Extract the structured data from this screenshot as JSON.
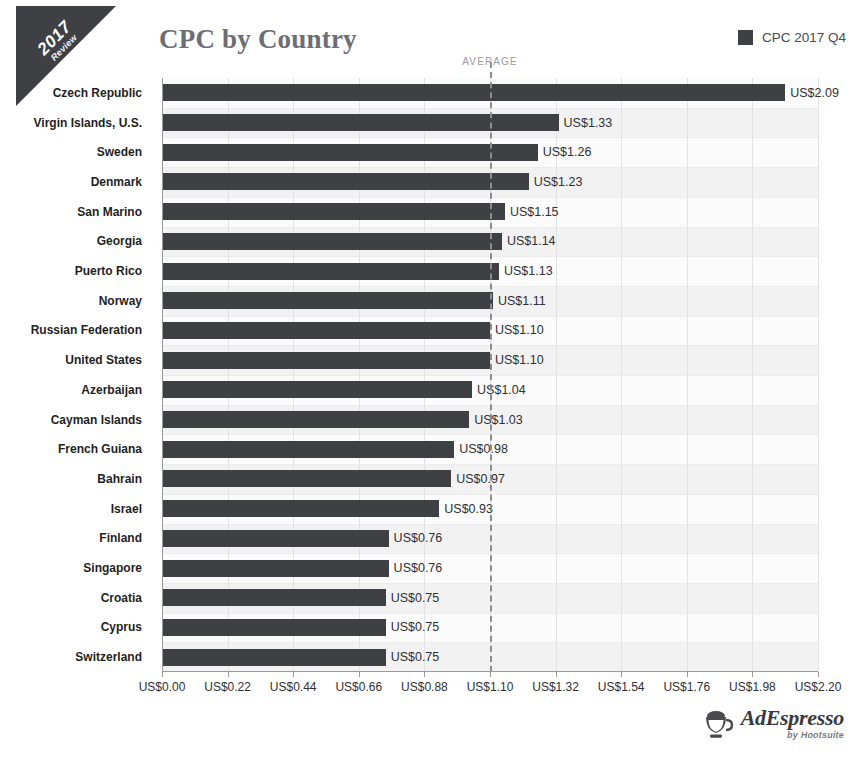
{
  "ribbon": {
    "year": "2017",
    "subtitle": "Review"
  },
  "header": {
    "title": "CPC by Country"
  },
  "legend": {
    "items": [
      {
        "label": "CPC 2017 Q4",
        "color": "#3f4044"
      }
    ]
  },
  "annotations": {
    "average_label": "AVERAGE",
    "average_value": 1.1
  },
  "footer": {
    "logo_name": "AdEspresso",
    "logo_by": "by Hootsuite",
    "caption": ""
  },
  "colors": {
    "bar": "#3f4044",
    "title": "#6e6e72",
    "plot_background": "#fbfbfb",
    "row_band": "#f2f2f2",
    "gridline": "#e2e2e2",
    "axis": "#9a9a9a",
    "average_line": "#8c8c90"
  },
  "chart_data": {
    "type": "bar",
    "orientation": "horizontal",
    "title": "CPC by Country",
    "xlabel": "",
    "ylabel": "",
    "xlim": [
      0,
      2.2
    ],
    "grid": true,
    "legend_position": "top-right",
    "value_prefix": "US$",
    "xticks": [
      0.0,
      0.22,
      0.44,
      0.66,
      0.88,
      1.1,
      1.32,
      1.54,
      1.76,
      1.98,
      2.2
    ],
    "xtick_labels": [
      "US$0.00",
      "US$0.22",
      "US$0.44",
      "US$0.66",
      "US$0.88",
      "US$1.10",
      "US$1.32",
      "US$1.54",
      "US$1.76",
      "US$1.98",
      "US$2.20"
    ],
    "series": [
      {
        "name": "CPC 2017 Q4",
        "color": "#3f4044",
        "values": [
          2.09,
          1.33,
          1.26,
          1.23,
          1.15,
          1.14,
          1.13,
          1.11,
          1.1,
          1.1,
          1.04,
          1.03,
          0.98,
          0.97,
          0.93,
          0.76,
          0.76,
          0.75,
          0.75,
          0.75
        ]
      }
    ],
    "categories": [
      "Czech Republic",
      "Virgin Islands, U.S.",
      "Sweden",
      "Denmark",
      "San Marino",
      "Georgia",
      "Puerto Rico",
      "Norway",
      "Russian Federation",
      "United States",
      "Azerbaijan",
      "Cayman Islands",
      "French Guiana",
      "Bahrain",
      "Israel",
      "Finland",
      "Singapore",
      "Croatia",
      "Cyprus",
      "Switzerland"
    ],
    "data_labels": [
      "US$2.09",
      "US$1.33",
      "US$1.26",
      "US$1.23",
      "US$1.15",
      "US$1.14",
      "US$1.13",
      "US$1.11",
      "US$1.10",
      "US$1.10",
      "US$1.04",
      "US$1.03",
      "US$0.98",
      "US$0.97",
      "US$0.93",
      "US$0.76",
      "US$0.76",
      "US$0.75",
      "US$0.75",
      "US$0.75"
    ],
    "average": 1.1
  }
}
